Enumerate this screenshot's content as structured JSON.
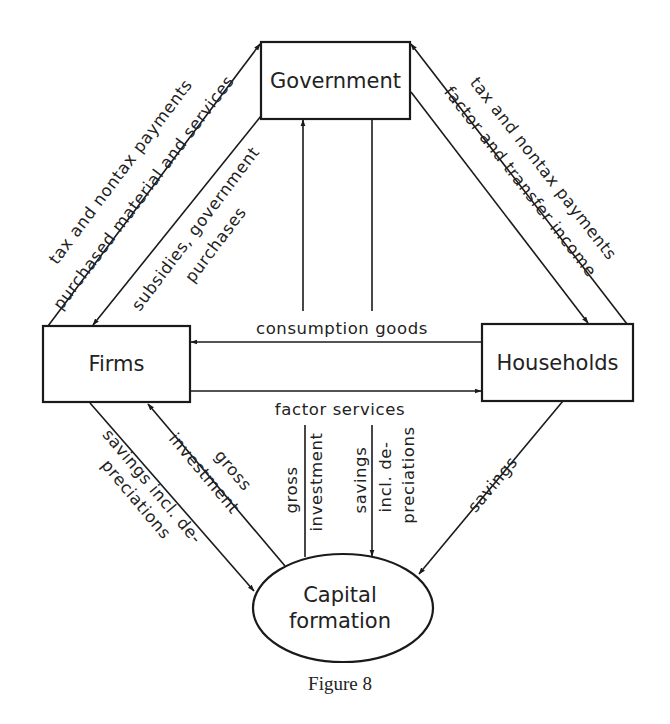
{
  "figure": {
    "caption": "Figure 8"
  },
  "nodes": {
    "government": {
      "label": "Government",
      "shape": "rectangle"
    },
    "firms": {
      "label": "Firms",
      "shape": "rectangle"
    },
    "households": {
      "label": "Households",
      "shape": "rectangle"
    },
    "capital_formation": {
      "label_line1": "Capital",
      "label_line2": "formation",
      "shape": "ellipse"
    }
  },
  "edges": {
    "firms_to_government": {
      "from": "Firms",
      "to": "Government",
      "label": "tax and nontax payments"
    },
    "government_to_firms_purchased": {
      "label": "purchased material and services"
    },
    "government_to_firms": {
      "from": "Government",
      "to": "Firms",
      "label_line1": "subsidies, government",
      "label_line2": "purchases"
    },
    "households_to_government": {
      "from": "Households",
      "to": "Government",
      "label": "tax and nontax payments"
    },
    "government_to_households": {
      "from": "Government",
      "to": "Households",
      "label": "factor and transfer income"
    },
    "households_to_firms": {
      "from": "Households",
      "to": "Firms",
      "label": "consumption goods"
    },
    "firms_to_households": {
      "from": "Firms",
      "to": "Households",
      "label": "factor services"
    },
    "firms_to_capital": {
      "from": "Firms",
      "to": "Capital formation",
      "label_line1": "savings incl. de-",
      "label_line2": "preciations"
    },
    "capital_to_firms": {
      "from": "Capital formation",
      "to": "Firms",
      "label_line1": "gross",
      "label_line2": "investment"
    },
    "capital_to_government": {
      "from": "Capital formation",
      "to": "Government",
      "label_line1": "gross",
      "label_line2": "investment"
    },
    "government_to_capital": {
      "from": "Government",
      "to": "Capital formation",
      "label_line1": "savings",
      "label_line2": "incl. de-",
      "label_line3": "preciations"
    },
    "households_to_capital": {
      "from": "Households",
      "to": "Capital formation",
      "label": "savings"
    }
  },
  "colors": {
    "ink": "#1a1a1a",
    "background": "#ffffff"
  }
}
